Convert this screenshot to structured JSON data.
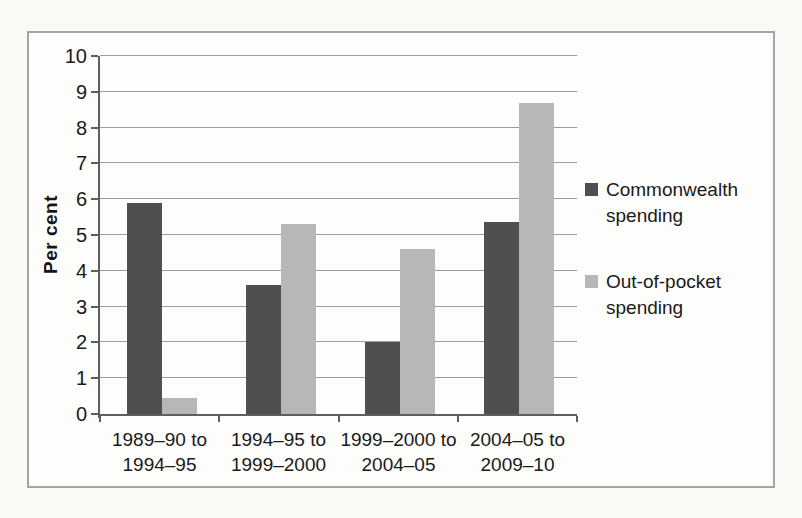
{
  "figure": {
    "type_note": "scanned grouped bar chart, no title shown",
    "background_color": "#fdfdfb",
    "frame_border_color": "#a5a5a5"
  },
  "chart_data": {
    "type": "bar",
    "title": "",
    "xlabel": "",
    "ylabel": "Per cent",
    "ylim": [
      0,
      10
    ],
    "ytick_step": 1,
    "grid": true,
    "legend_position": "right",
    "categories": [
      "1989–90 to 1994–95",
      "1994–95 to 1999–2000",
      "1999–2000 to 2004–05",
      "2004–05 to 2009–10"
    ],
    "category_lines": [
      [
        "1989–90 to",
        "1994–95"
      ],
      [
        "1994–95 to",
        "1999–2000"
      ],
      [
        "1999–2000 to",
        "2004–05"
      ],
      [
        "2004–05 to",
        "2009–10"
      ]
    ],
    "yticks": [
      0,
      1,
      2,
      3,
      4,
      5,
      6,
      7,
      8,
      9,
      10
    ],
    "series": [
      {
        "name": "Commonwealth spending",
        "color": "#4f4f4f",
        "values": [
          5.9,
          3.6,
          2.0,
          5.35
        ]
      },
      {
        "name": "Out-of-pocket spending",
        "color": "#b7b7b7",
        "values": [
          0.45,
          5.3,
          4.6,
          8.7
        ]
      }
    ],
    "gridline_color": "#9c9c9c",
    "axis_color": "#5e5e5e"
  }
}
